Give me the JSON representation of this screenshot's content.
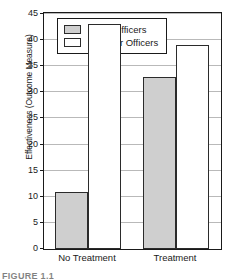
{
  "chart_data": {
    "type": "bar",
    "title": "",
    "xlabel": "",
    "ylabel": "Effectiveness (Outcome Measure)",
    "categories": [
      "No Treatment",
      "Treatment"
    ],
    "series": [
      {
        "name": "Older Officers",
        "values": [
          11,
          33
        ],
        "color": "#cfcfcf"
      },
      {
        "name": "Younger Officers",
        "values": [
          43,
          39
        ],
        "color": "#ffffff"
      }
    ],
    "ylim": [
      0,
      45
    ],
    "yticks": [
      0,
      5,
      10,
      15,
      20,
      25,
      30,
      35,
      40,
      45
    ],
    "ytick_labels": [
      "0",
      "5",
      "10",
      "15",
      "20",
      "25",
      "30",
      "35",
      "40",
      "45"
    ],
    "grid": true,
    "legend_position": "top-center"
  },
  "legend": {
    "items": [
      {
        "label": "Older Officers",
        "swatch": "older"
      },
      {
        "label": "Younger Officers",
        "swatch": "younger"
      }
    ]
  },
  "caption": {
    "text": "FIGURE 1.1"
  },
  "colors": {
    "older_fill": "#cfcfcf",
    "younger_fill": "#ffffff",
    "bar_stroke": "#2b2b2b",
    "gridline": "#b9b9b9",
    "axis": "#1a1a1a",
    "background": "#ffffff"
  }
}
